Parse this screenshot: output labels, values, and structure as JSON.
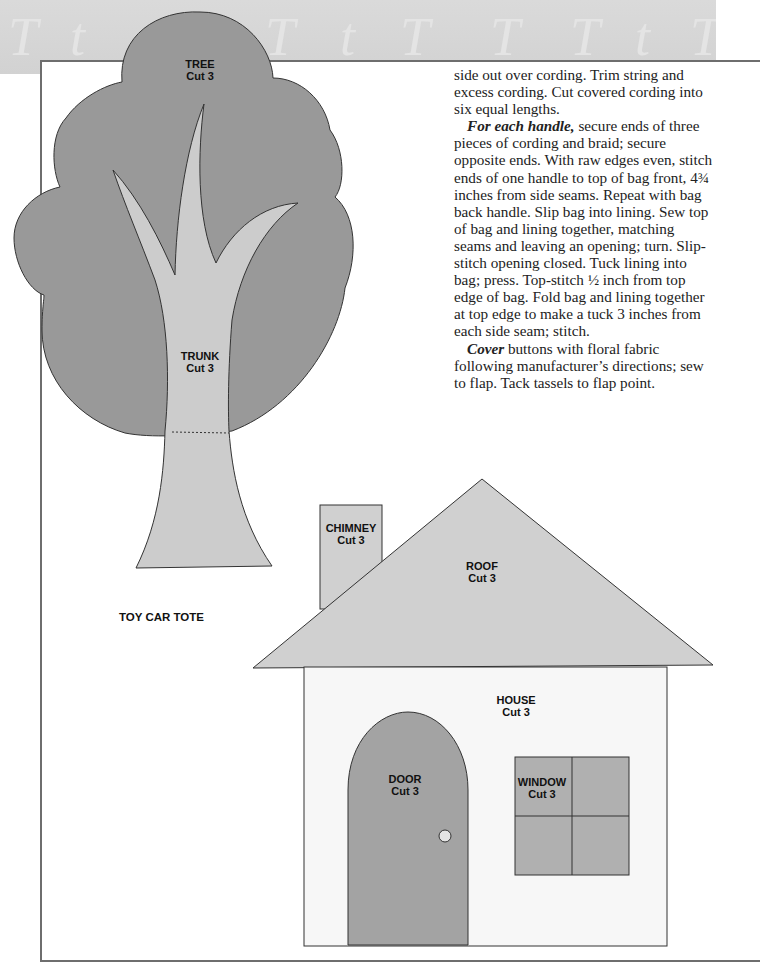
{
  "banner": {
    "letters": [
      "T",
      "t",
      "T",
      "T",
      "t",
      "T",
      "T",
      "T",
      "t",
      "T"
    ]
  },
  "page_title": "TOY CAR TOTE",
  "pattern_pieces": {
    "tree": {
      "name": "TREE",
      "instruction": "Cut 3"
    },
    "trunk": {
      "name": "TRUNK",
      "instruction": "Cut 3"
    },
    "chimney": {
      "name": "CHIMNEY",
      "instruction": "Cut 3"
    },
    "roof": {
      "name": "ROOF",
      "instruction": "Cut 3"
    },
    "house": {
      "name": "HOUSE",
      "instruction": "Cut 3"
    },
    "door": {
      "name": "DOOR",
      "instruction": "Cut 3"
    },
    "window": {
      "name": "WINDOW",
      "instruction": "Cut 3"
    }
  },
  "colors": {
    "tree_fill": "#999999",
    "trunk_fill": "#cccccc",
    "roof_fill": "#d0d0d0",
    "house_fill": "#f7f7f7",
    "door_fill": "#a3a3a3",
    "window_fill": "#b0b0b0"
  },
  "instructions": {
    "para1": "side out over cording. Trim string and excess cording. Cut covered cording into six equal lengths.",
    "para2_lead": "For each handle,",
    "para2_body": " secure ends of three pieces of cording and braid; secure opposite ends. With raw edges even, stitch ends of one handle to top of bag front, 4¾ inches from side seams. Repeat with bag back handle. Slip bag into lining. Sew top of bag and lining together, matching seams and leaving an opening; turn. Slip-stitch opening closed. Tuck lining into bag; press. Top-stitch ½ inch from top edge of bag. Fold bag and lining together at top edge to make a tuck 3 inches from each side seam; stitch.",
    "para3_lead": "Cover",
    "para3_body": " buttons with floral fabric following manufacturer’s directions; sew to flap. Tack tassels to flap point."
  }
}
